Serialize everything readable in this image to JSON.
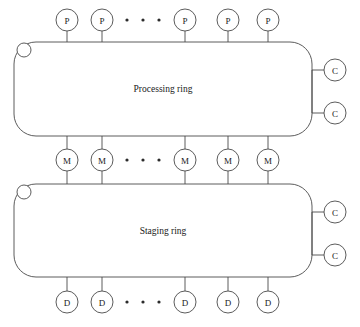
{
  "diagram": {
    "stroke_color": "#4a4a4a",
    "text_color": "#1a1a1a",
    "background_color": "#ffffff",
    "rings": [
      {
        "id": "processing-ring",
        "label": "Processing ring",
        "x": 14,
        "y": 42,
        "width": 298,
        "height": 94,
        "corner_radius": 22,
        "token_circle": {
          "cx": 24,
          "cy": 50,
          "r": 7
        }
      },
      {
        "id": "staging-ring",
        "label": "Staging ring",
        "x": 14,
        "y": 184,
        "width": 298,
        "height": 93,
        "corner_radius": 22,
        "token_circle": {
          "cx": 24,
          "cy": 192,
          "r": 7
        }
      }
    ],
    "node_rows": [
      {
        "id": "processor-row",
        "node_label": "P",
        "node_name": "processor-node",
        "cy": 20,
        "r": 11,
        "xs": [
          67,
          102,
          185,
          228,
          268
        ],
        "stem": {
          "from": "bottom",
          "to_y": 42
        },
        "ellipsis": {
          "cy": 20,
          "xs": [
            127,
            143,
            159
          ],
          "r": 1.6
        }
      },
      {
        "id": "memory-row",
        "node_label": "M",
        "node_name": "memory-node",
        "cy": 160,
        "r": 11,
        "xs": [
          67,
          102,
          185,
          228,
          268
        ],
        "stem": {
          "from": "both",
          "top_y": 136,
          "bottom_y": 184
        },
        "ellipsis": {
          "cy": 160,
          "xs": [
            127,
            143,
            159
          ],
          "r": 1.6
        }
      },
      {
        "id": "disk-row",
        "node_label": "D",
        "node_name": "disk-node",
        "cy": 302,
        "r": 11,
        "xs": [
          67,
          102,
          185,
          228,
          268
        ],
        "stem": {
          "from": "top",
          "to_y": 277
        },
        "ellipsis": {
          "cy": 302,
          "xs": [
            127,
            143,
            159
          ],
          "r": 1.6
        }
      }
    ],
    "controller_groups": [
      {
        "id": "processing-controllers",
        "bus_x": 312,
        "bus_y1": 70,
        "bus_y2": 113,
        "node_label": "C",
        "node_name": "controller-node",
        "r": 11,
        "cx": 335,
        "cys": [
          70,
          113
        ]
      },
      {
        "id": "staging-controllers",
        "bus_x": 312,
        "bus_y1": 212,
        "bus_y2": 255,
        "node_label": "C",
        "node_name": "controller-node",
        "r": 11,
        "cx": 335,
        "cys": [
          212,
          255
        ]
      }
    ]
  }
}
